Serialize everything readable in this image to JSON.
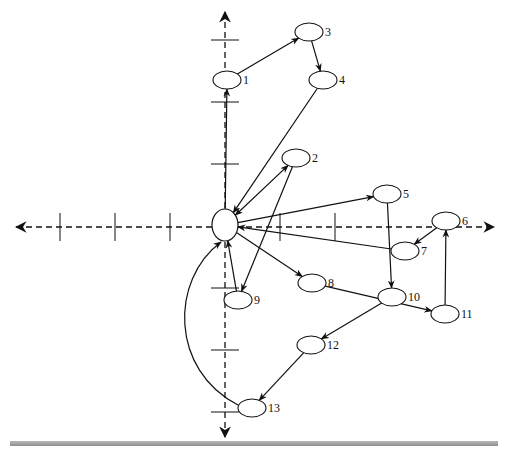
{
  "diagram": {
    "type": "directed-graph-on-axes",
    "center_node": {
      "id": "center",
      "cx": 225,
      "cy": 225,
      "rx": 13,
      "ry": 16
    },
    "axes": {
      "color": "#111111",
      "horizontal": {
        "y": 227,
        "x_from": 16,
        "x_to": 494
      },
      "vertical": {
        "x": 225,
        "y_from": 12,
        "y_to": 437
      },
      "h_ticks": [
        60,
        115,
        170,
        280,
        335
      ],
      "v_ticks": [
        40,
        102,
        164,
        288,
        350,
        412
      ]
    },
    "nodes": [
      {
        "id": "1",
        "label": "1",
        "cx": 227,
        "cy": 80
      },
      {
        "id": "2",
        "label": "2",
        "cx": 296,
        "cy": 158
      },
      {
        "id": "3",
        "label": "3",
        "cx": 309,
        "cy": 32
      },
      {
        "id": "4",
        "label": "4",
        "cx": 323,
        "cy": 80
      },
      {
        "id": "5",
        "label": "5",
        "cx": 387,
        "cy": 194
      },
      {
        "id": "6",
        "label": "6",
        "cx": 446,
        "cy": 221
      },
      {
        "id": "7",
        "label": "7",
        "cx": 405,
        "cy": 251
      },
      {
        "id": "8",
        "label": "8",
        "cx": 312,
        "cy": 283
      },
      {
        "id": "9",
        "label": "9",
        "cx": 238,
        "cy": 300
      },
      {
        "id": "10",
        "label": "10",
        "cx": 392,
        "cy": 297
      },
      {
        "id": "11",
        "label": "11",
        "cx": 445,
        "cy": 314
      },
      {
        "id": "12",
        "label": "12",
        "cx": 311,
        "cy": 345
      },
      {
        "id": "13",
        "label": "13",
        "cx": 252,
        "cy": 408
      }
    ],
    "edges": [
      {
        "from": "center",
        "to": "1"
      },
      {
        "from": "1",
        "to": "3"
      },
      {
        "from": "3",
        "to": "4"
      },
      {
        "from": "4",
        "to": "center"
      },
      {
        "from": "center",
        "to": "2",
        "bidirectional": true
      },
      {
        "from": "2",
        "to": "9"
      },
      {
        "from": "9",
        "to": "center"
      },
      {
        "from": "center",
        "to": "5"
      },
      {
        "from": "7",
        "to": "center"
      },
      {
        "from": "center",
        "to": "8"
      },
      {
        "from": "5",
        "to": "10"
      },
      {
        "from": "6",
        "to": "7"
      },
      {
        "from": "11",
        "to": "6"
      },
      {
        "from": "8",
        "to": "11"
      },
      {
        "from": "10",
        "to": "12"
      },
      {
        "from": "12",
        "to": "13"
      },
      {
        "from": "13",
        "to": "center",
        "curved": true
      }
    ]
  }
}
